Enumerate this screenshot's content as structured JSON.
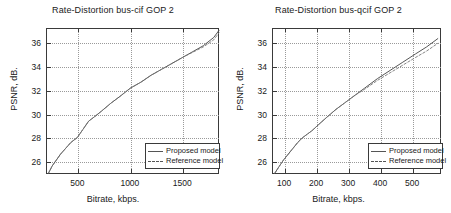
{
  "figures": [
    {
      "title": "Rate-Distortion bus-cif GOP 2",
      "xlabel": "Bitrate, kbps.",
      "ylabel": "PSNR, dB.",
      "legend": {
        "proposed": "Proposed model",
        "reference": "Reference model"
      },
      "xticks": [
        "500",
        "1000",
        "1500"
      ],
      "yticks": [
        "26",
        "28",
        "30",
        "32",
        "34",
        "36"
      ]
    },
    {
      "title": "Rate-Distortion bus-qcif GOP 2",
      "xlabel": "Bitrate, kbps.",
      "ylabel": "PSNR, dB.",
      "legend": {
        "proposed": "Proposed model",
        "reference": "Reference model"
      },
      "xticks": [
        "100",
        "200",
        "300",
        "400",
        "500"
      ],
      "yticks": [
        "26",
        "28",
        "30",
        "32",
        "34",
        "36"
      ]
    }
  ],
  "chart_data": [
    {
      "type": "line",
      "title": "Rate-Distortion bus-cif GOP 2",
      "xlabel": "Bitrate, kbps.",
      "ylabel": "PSNR, dB.",
      "xlim": [
        200,
        1850
      ],
      "ylim": [
        25.0,
        37.3
      ],
      "xticks": [
        500,
        1000,
        1500
      ],
      "yticks": [
        26,
        28,
        30,
        32,
        34,
        36
      ],
      "grid": true,
      "legend_position": "lower right",
      "series": [
        {
          "name": "Proposed model",
          "style": "solid",
          "color": "#555555",
          "x": [
            215,
            250,
            290,
            330,
            380,
            430,
            490,
            545,
            600,
            660,
            730,
            810,
            900,
            1000,
            1100,
            1200,
            1300,
            1400,
            1500,
            1600,
            1700,
            1800,
            1850
          ],
          "y": [
            25.0,
            25.6,
            26.1,
            26.6,
            27.1,
            27.6,
            28.0,
            28.7,
            29.4,
            29.8,
            30.3,
            30.9,
            31.5,
            32.2,
            32.7,
            33.3,
            33.8,
            34.3,
            34.8,
            35.3,
            35.8,
            36.5,
            37.1
          ]
        },
        {
          "name": "Reference model",
          "style": "dashed",
          "color": "#777777",
          "x": [
            215,
            250,
            290,
            330,
            380,
            430,
            490,
            545,
            600,
            660,
            730,
            810,
            900,
            1000,
            1100,
            1200,
            1300,
            1400,
            1500,
            1600,
            1700,
            1800,
            1850
          ],
          "y": [
            25.0,
            25.6,
            26.1,
            26.6,
            27.1,
            27.6,
            28.0,
            28.7,
            29.4,
            29.8,
            30.3,
            30.9,
            31.5,
            32.2,
            32.7,
            33.3,
            33.8,
            34.3,
            34.8,
            35.25,
            35.7,
            36.3,
            36.9
          ]
        }
      ]
    },
    {
      "type": "line",
      "title": "Rate-Distortion bus-qcif GOP 2",
      "xlabel": "Bitrate, kbps.",
      "ylabel": "PSNR, dB.",
      "xlim": [
        62,
        590
      ],
      "ylim": [
        25.0,
        37.3
      ],
      "xticks": [
        100,
        200,
        300,
        400,
        500
      ],
      "yticks": [
        26,
        28,
        30,
        32,
        34,
        36
      ],
      "grid": true,
      "legend_position": "lower right",
      "series": [
        {
          "name": "Proposed model",
          "style": "solid",
          "color": "#555555",
          "x": [
            68,
            80,
            95,
            110,
            125,
            140,
            155,
            170,
            185,
            205,
            230,
            260,
            290,
            320,
            350,
            390,
            430,
            470,
            510,
            545,
            580
          ],
          "y": [
            25.0,
            25.5,
            26.1,
            26.6,
            27.1,
            27.6,
            28.0,
            28.3,
            28.6,
            29.1,
            29.7,
            30.4,
            31.0,
            31.6,
            32.2,
            33.0,
            33.7,
            34.4,
            35.1,
            35.7,
            36.4
          ]
        },
        {
          "name": "Reference model",
          "style": "dashed",
          "color": "#777777",
          "x": [
            68,
            80,
            95,
            110,
            125,
            140,
            155,
            170,
            185,
            205,
            230,
            260,
            290,
            320,
            350,
            390,
            430,
            470,
            510,
            545,
            580
          ],
          "y": [
            25.0,
            25.5,
            26.1,
            26.6,
            27.1,
            27.6,
            28.0,
            28.3,
            28.6,
            29.1,
            29.7,
            30.4,
            31.0,
            31.6,
            32.1,
            32.85,
            33.5,
            34.15,
            34.8,
            35.35,
            36.0
          ]
        }
      ]
    }
  ]
}
